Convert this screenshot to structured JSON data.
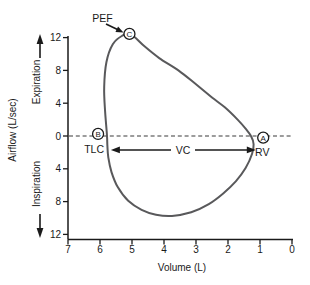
{
  "figure": {
    "aria_label": "Flow-volume loop diagram",
    "background": "#ffffff"
  },
  "chart_data": {
    "type": "line",
    "xlabel": "Volume (L)",
    "ylabel": "Airflow (L/sec)",
    "x_tick_labels": [
      "7",
      "6",
      "5",
      "4",
      "3",
      "2",
      "1",
      "0"
    ],
    "x_tick_values": [
      7,
      6,
      5,
      4,
      3,
      2,
      1,
      0
    ],
    "y_tick_labels": [
      "12",
      "8",
      "4",
      "0",
      "4",
      "8",
      "12"
    ],
    "y_tick_values": [
      12,
      8,
      4,
      0,
      -4,
      -8,
      -12
    ],
    "x_domain_left_to_right": [
      7,
      0
    ],
    "y_domain": [
      -12,
      12
    ],
    "grid": false,
    "legend": null,
    "zero_line_style": "dashed",
    "direction_labels": {
      "expiratory": "Expiration",
      "inspiratory": "Inspiration"
    },
    "colors": {
      "curve": "#59595b",
      "axis": "#1a1a1a",
      "text": "#1a1a1a",
      "dashed_line": "#3a3a3a",
      "marker_fill": "#ffffff"
    },
    "series": [
      {
        "name": "flow-volume-loop",
        "closed": true,
        "points_volume_flow": [
          [
            5.78,
            0
          ],
          [
            5.84,
            3
          ],
          [
            5.87,
            6
          ],
          [
            5.8,
            9
          ],
          [
            5.6,
            11.2
          ],
          [
            5.32,
            12.2
          ],
          [
            5.05,
            12.45
          ],
          [
            4.6,
            10.9
          ],
          [
            4.15,
            9.5
          ],
          [
            3.55,
            8.0
          ],
          [
            3.0,
            6.3
          ],
          [
            2.5,
            4.7
          ],
          [
            2.1,
            3.5
          ],
          [
            1.7,
            2.0
          ],
          [
            1.45,
            0.9
          ],
          [
            1.28,
            0
          ],
          [
            1.2,
            -1.0
          ],
          [
            1.25,
            -2.2
          ],
          [
            1.45,
            -3.9
          ],
          [
            1.75,
            -5.5
          ],
          [
            2.15,
            -7.0
          ],
          [
            2.6,
            -8.3
          ],
          [
            3.15,
            -9.3
          ],
          [
            3.75,
            -9.75
          ],
          [
            4.25,
            -9.6
          ],
          [
            4.7,
            -9.0
          ],
          [
            5.12,
            -7.9
          ],
          [
            5.45,
            -6.2
          ],
          [
            5.64,
            -4.4
          ],
          [
            5.74,
            -2.6
          ],
          [
            5.77,
            -1.2
          ]
        ]
      }
    ],
    "markers": [
      {
        "id": "C",
        "letter": "C",
        "x": 5.08,
        "y": 12.45,
        "caption": "PEF"
      },
      {
        "id": "B",
        "letter": "B",
        "x": 6.06,
        "y": 0.25,
        "caption": "TLC"
      },
      {
        "id": "A",
        "letter": "A",
        "x": 0.9,
        "y": -0.2,
        "caption": "RV"
      }
    ],
    "span_arrow": {
      "label": "VC",
      "from_x": 5.66,
      "to_x": 1.13,
      "y_flow": -1.7
    }
  }
}
